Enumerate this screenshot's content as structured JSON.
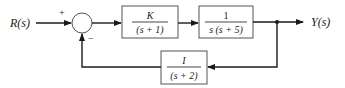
{
  "diagram": {
    "type": "block-diagram",
    "input_label": "R(s)",
    "output_label": "Y(s)",
    "summing_junction": {
      "plus_sign": "+",
      "minus_sign": "−"
    },
    "forward_blocks": [
      {
        "numerator": "K",
        "denominator": "(s + 1)"
      },
      {
        "numerator": "1",
        "denominator": "s (s + 5)"
      }
    ],
    "feedback_block": {
      "numerator": "I",
      "denominator": "(s + 2)"
    },
    "colors": {
      "line": "#1a1a1a",
      "box_border": "#555555",
      "background": "#ffffff"
    }
  }
}
